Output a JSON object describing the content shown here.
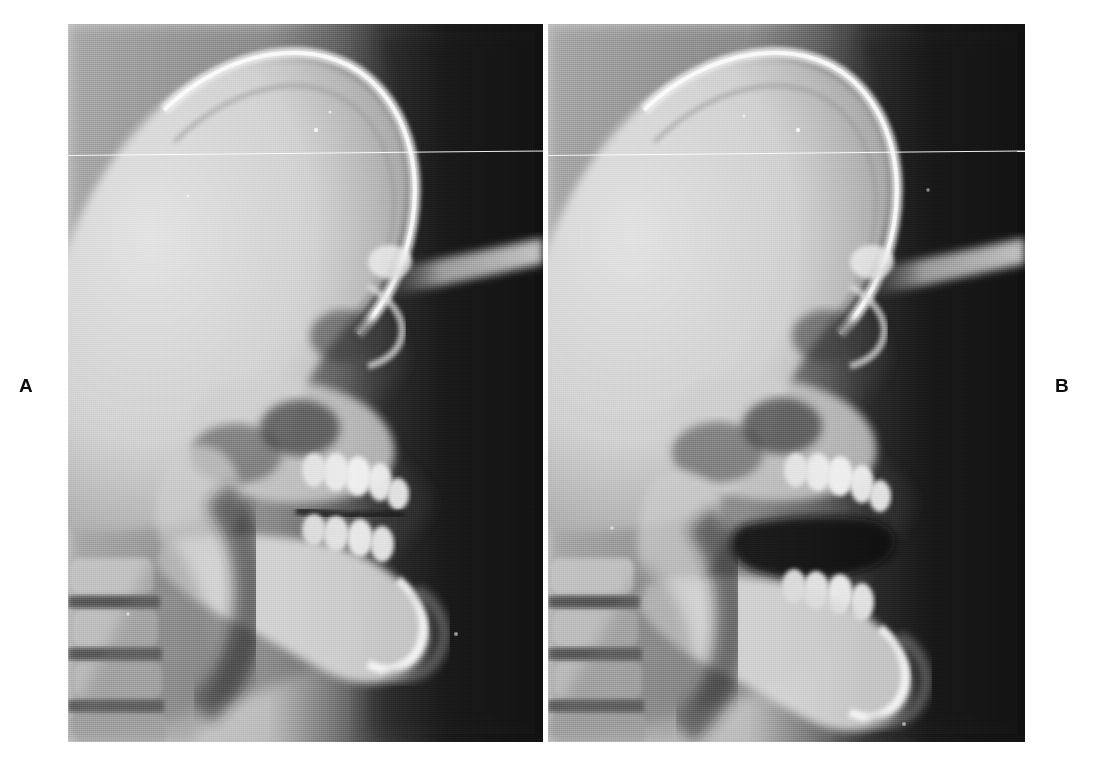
{
  "figure": {
    "type": "lateral-cephalometric-radiograph-pair",
    "background_color": "#ffffff",
    "width": 1097,
    "height": 770,
    "caption_labels": {
      "left": "A",
      "right": "B"
    }
  },
  "panels": [
    {
      "id": "panel-a",
      "label": "A",
      "label_position": "left-outside",
      "x": 68,
      "y": 24,
      "width": 475,
      "height": 718,
      "modality": "lateral cephalometric radiograph",
      "orientation": "profile facing right",
      "bite_state": "teeth in occlusion (closed bite)",
      "film_background_color": "#141414",
      "soft_tissue_color": "#6e6e6e",
      "bone_color": "#d8d8d8",
      "cranium_color": "#c9c9c9",
      "features": [
        "cranial vault",
        "frontal bone",
        "nasal bone and glabella profile",
        "orbital rim",
        "maxilla with dentition",
        "mandible with dentition",
        "mandibular symphysis and chin",
        "cervical vertebrae C1-C4",
        "cephalostat ear-rod shadow",
        "horizontal white scratch artifact"
      ]
    },
    {
      "id": "panel-b",
      "label": "B",
      "label_position": "right-outside",
      "x": 548,
      "y": 24,
      "width": 477,
      "height": 718,
      "modality": "lateral cephalometric radiograph",
      "orientation": "profile facing right",
      "bite_state": "mandible lowered (open bite / rest position)",
      "film_background_color": "#141414",
      "soft_tissue_color": "#6e6e6e",
      "bone_color": "#d8d8d8",
      "cranium_color": "#c9c9c9",
      "features": [
        "cranial vault",
        "frontal bone",
        "nasal bone and glabella profile",
        "orbital rim",
        "maxilla with dentition",
        "mandible with dentition, rotated open",
        "interocclusal space (dark airway gap)",
        "mandibular symphysis and chin",
        "cervical vertebrae C1-C4",
        "cephalostat ear-rod shadow",
        "horizontal white scratch artifact"
      ]
    }
  ]
}
